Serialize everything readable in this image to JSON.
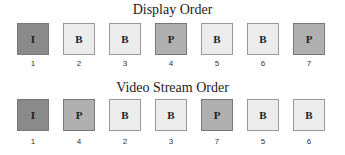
{
  "display_order": {
    "title": "Display Order",
    "frames": [
      {
        "type": "I",
        "number": "1"
      },
      {
        "type": "B",
        "number": "2"
      },
      {
        "type": "B",
        "number": "3"
      },
      {
        "type": "P",
        "number": "4"
      },
      {
        "type": "B",
        "number": "5"
      },
      {
        "type": "B",
        "number": "6"
      },
      {
        "type": "P",
        "number": "7"
      }
    ]
  },
  "stream_order": {
    "title": "Video Stream Order",
    "frames": [
      {
        "type": "I",
        "number": "1"
      },
      {
        "type": "P",
        "number": "4"
      },
      {
        "type": "B",
        "number": "2"
      },
      {
        "type": "B",
        "number": "3"
      },
      {
        "type": "P",
        "number": "7"
      },
      {
        "type": "B",
        "number": "5"
      },
      {
        "type": "B",
        "number": "6"
      }
    ]
  },
  "colors": {
    "I": "#8a8a8a",
    "P": "#b0b0b0",
    "B": "#ececec"
  }
}
